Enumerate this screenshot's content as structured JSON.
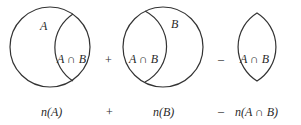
{
  "figures": {
    "fig1": {
      "region_label": "A",
      "overlap_label": "A ∩ B"
    },
    "fig2": {
      "region_label": "B",
      "overlap_label": "A ∩ B"
    },
    "fig3": {
      "overlap_label": "A ∩ B"
    }
  },
  "operators": {
    "top_plus": "+",
    "top_minus": "–",
    "bottom_plus": "+",
    "bottom_minus": "–"
  },
  "captions": {
    "nA": "n(A)",
    "nB": "n(B)",
    "nAB": "n(A ∩ B)"
  },
  "colors": {
    "stroke": "#333333",
    "text": "#2a2a2a"
  }
}
